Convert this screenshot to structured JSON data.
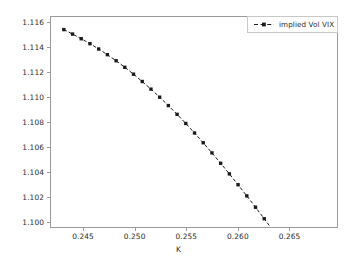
{
  "chart_data": {
    "type": "line",
    "title": "",
    "xlabel": "K",
    "ylabel": "",
    "xlim": [
      0.2418,
      0.2697
    ],
    "ylim": [
      1.0995,
      1.1165
    ],
    "grid": false,
    "legend_position": "upper right",
    "xticks": [
      0.245,
      0.25,
      0.255,
      0.26,
      0.265
    ],
    "xtick_labels": [
      "0.245",
      "0.250",
      "0.255",
      "0.260",
      "0.265"
    ],
    "yticks": [
      1.1,
      1.102,
      1.104,
      1.106,
      1.108,
      1.11,
      1.112,
      1.114,
      1.116
    ],
    "ytick_labels": [
      "1.100",
      "1.102",
      "1.104",
      "1.106",
      "1.108",
      "1.110",
      "1.112",
      "1.114",
      "1.116"
    ],
    "series": [
      {
        "name": "implied Vol VIX",
        "color": "#1a1a1a",
        "linestyle": "dashed",
        "marker": "square",
        "x": [
          0.24305,
          0.2439,
          0.24475,
          0.2456,
          0.24645,
          0.2473,
          0.24815,
          0.249,
          0.24985,
          0.2507,
          0.25155,
          0.2524,
          0.25325,
          0.2541,
          0.25495,
          0.2558,
          0.25665,
          0.2575,
          0.25835,
          0.2592,
          0.26005,
          0.2609,
          0.26175,
          0.2626,
          0.26345,
          0.2643,
          0.26515,
          0.266,
          0.26685,
          0.2677,
          0.26855
        ],
        "y": [
          1.11548,
          1.11512,
          1.11474,
          1.11434,
          1.11391,
          1.11345,
          1.11296,
          1.11243,
          1.11187,
          1.11128,
          1.11066,
          1.11001,
          1.10933,
          1.10862,
          1.10788,
          1.10711,
          1.10632,
          1.1055,
          1.10466,
          1.1038,
          1.10292,
          1.10202,
          1.1011,
          1.10017,
          1.09922,
          1.09826,
          1.09729,
          1.09631,
          1.09532,
          1.09432,
          1.09331
        ]
      }
    ]
  },
  "legend": {
    "entries": [
      {
        "label": "implied Vol VIX"
      }
    ]
  },
  "axis": {
    "xlabel": "K"
  },
  "icons": {
    "legend_marker": "dashed-line-with-square-marker"
  }
}
